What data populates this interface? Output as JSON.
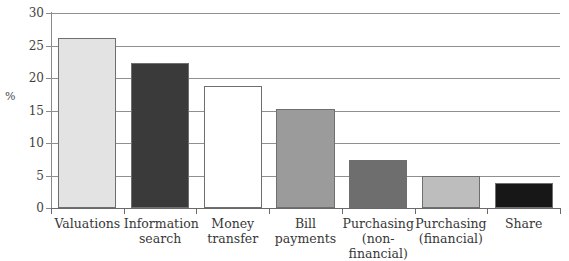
{
  "chart_data": {
    "type": "bar",
    "title": "",
    "subtitle": "",
    "xlabel": "",
    "ylabel": "%",
    "ylim": [
      0,
      30
    ],
    "ytick_step": 5,
    "yticks": [
      0,
      5,
      10,
      15,
      20,
      25,
      30
    ],
    "ytick_labels": [
      "0",
      "5",
      "10",
      "15",
      "20",
      "25",
      "30"
    ],
    "grid": true,
    "grid_axis": "y",
    "legend": false,
    "legend_position": "none",
    "categories": [
      "Valuations",
      "Information search",
      "Money transfer",
      "Bill payments",
      "Purchasing (non-financial)",
      "Purchasing (financial)",
      "Share"
    ],
    "category_lines": [
      [
        "Valuations"
      ],
      [
        "Information",
        "search"
      ],
      [
        "Money",
        "transfer"
      ],
      [
        "Bill",
        "payments"
      ],
      [
        "Purchasing",
        "(non-financial)"
      ],
      [
        "Purchasing",
        "(financial)"
      ],
      [
        "Share"
      ]
    ],
    "values": [
      26.2,
      22.3,
      18.8,
      15.2,
      7.4,
      4.9,
      3.9
    ],
    "bar_colors": [
      "#e3e3e3",
      "#3a3a3a",
      "#ffffff",
      "#9b9b9b",
      "#6e6e6e",
      "#bdbdbd",
      "#171717"
    ],
    "bar_outline_color": "#6f6f6f",
    "gridline_color": "#8f8f8f",
    "axis_color": "#6a6a6a",
    "text_color": "#383838",
    "background_color": "#ffffff"
  }
}
